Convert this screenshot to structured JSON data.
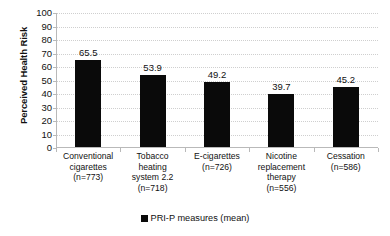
{
  "chart_data": {
    "type": "bar",
    "title": "",
    "xlabel": "",
    "ylabel": "Perceived Health Risk",
    "ylim": [
      0,
      100
    ],
    "ytick_step": 10,
    "yticks": [
      100,
      90,
      80,
      70,
      60,
      50,
      40,
      30,
      20,
      10,
      0
    ],
    "grid": true,
    "legend_position": "bottom",
    "bar_color": "#0a0a0a",
    "gridline_color": "#cfcfcf",
    "axis_color": "#b9b9b9",
    "categories": [
      "Conventional cigarettes (n=773)",
      "Tobacco heating system 2.2 (n=718)",
      "E-cigarettes (n=726)",
      "Nicotine replacement therapy (n=556)",
      "Cessation (n=586)"
    ],
    "category_lines": [
      [
        "Conventional",
        "cigarettes",
        "(n=773)"
      ],
      [
        "Tobacco",
        "heating",
        "system 2.2",
        "(n=718)"
      ],
      [
        "E-cigarettes",
        "(n=726)"
      ],
      [
        "Nicotine",
        "replacement",
        "therapy",
        "(n=556)"
      ],
      [
        "Cessation",
        "(n=586)"
      ]
    ],
    "sample_sizes": [
      773,
      718,
      726,
      556,
      586
    ],
    "values": [
      65.5,
      53.9,
      49.2,
      39.7,
      45.2
    ],
    "value_labels": [
      "65.5",
      "53.9",
      "49.2",
      "39.7",
      "45.2"
    ],
    "series": [
      {
        "name": "PRI-P measures (mean)",
        "values": [
          65.5,
          53.9,
          49.2,
          39.7,
          45.2
        ]
      }
    ],
    "legend": [
      {
        "label": "PRI-P measures (mean)",
        "color": "#0a0a0a",
        "marker": "square"
      }
    ]
  }
}
